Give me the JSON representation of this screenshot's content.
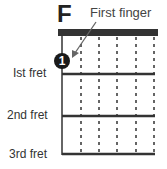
{
  "diagram": {
    "chord_name": "F",
    "callout": "First finger",
    "finger_marker": "1",
    "fret_labels": [
      "Ist fret",
      "2nd fret",
      "3rd fret"
    ],
    "strings": 6,
    "frets_shown": 3,
    "colors": {
      "nut": "#333333",
      "line": "#333333",
      "marker": "#1a1a1a",
      "marker_text": "#ffffff",
      "arrow": "#666666"
    }
  }
}
